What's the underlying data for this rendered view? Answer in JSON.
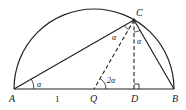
{
  "diagram": {
    "type": "geometry",
    "points": {
      "A": {
        "label": "A"
      },
      "B": {
        "label": "B"
      },
      "C": {
        "label": "C"
      },
      "Q": {
        "label": "Q"
      },
      "D": {
        "label": "D"
      }
    },
    "segment_labels": {
      "AQ": "1"
    },
    "angle_labels": {
      "at_A": "α",
      "at_C_between_CA_CQ": "α",
      "at_C_between_CD_CB": "α",
      "at_Q": "2α"
    },
    "line_styles": {
      "AC": "solid",
      "CB": "solid",
      "CQ": "dashed",
      "CD": "dashed",
      "AB": "solid",
      "arc": "solid"
    },
    "right_angle_at": "D",
    "colors": {
      "stroke": "#222222",
      "background": "#ffffff"
    }
  }
}
